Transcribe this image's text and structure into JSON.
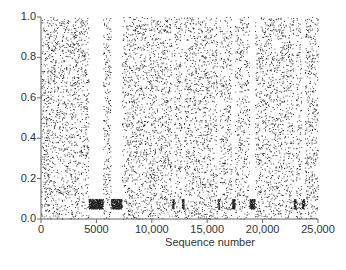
{
  "chart_data": {
    "type": "scatter",
    "title": "",
    "xlabel": "Sequence number",
    "ylabel": "",
    "xlim": [
      0,
      25000
    ],
    "ylim": [
      0.0,
      1.0
    ],
    "x_ticks": [
      "0",
      "5000",
      "10,000",
      "15,000",
      "20,000",
      "25,000"
    ],
    "y_ticks": [
      "0.0",
      "0.2",
      "0.4",
      "0.6",
      "0.8",
      "1.0"
    ],
    "grid": false,
    "legend": null,
    "gaps": [
      {
        "start": 4300,
        "end": 5600,
        "band": [
          0.05,
          0.1
        ]
      },
      {
        "start": 6300,
        "end": 7300,
        "band": [
          0.05,
          0.1
        ]
      },
      {
        "start": 11800,
        "end": 12000,
        "band": [
          0.05,
          0.1
        ]
      },
      {
        "start": 12700,
        "end": 12900,
        "band": [
          0.05,
          0.1
        ]
      },
      {
        "start": 15900,
        "end": 16100,
        "band": [
          0.05,
          0.1
        ]
      },
      {
        "start": 17200,
        "end": 17500,
        "band": [
          0.05,
          0.1
        ]
      },
      {
        "start": 18800,
        "end": 19300,
        "band": [
          0.05,
          0.1
        ]
      },
      {
        "start": 22800,
        "end": 23000,
        "band": [
          0.05,
          0.1
        ]
      },
      {
        "start": 23500,
        "end": 23800,
        "band": [
          0.05,
          0.1
        ]
      }
    ]
  }
}
